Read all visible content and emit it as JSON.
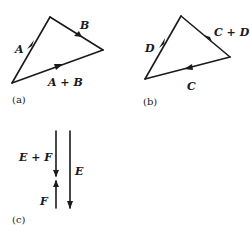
{
  "panels": {
    "a": {
      "caption": "(a)",
      "labels": {
        "A": "A",
        "B": "B",
        "sum": "A + B"
      }
    },
    "b": {
      "caption": "(b)",
      "labels": {
        "D": "D",
        "C": "C",
        "sum": "C + D"
      }
    },
    "c": {
      "caption": "(c)",
      "labels": {
        "sum": "E + F",
        "F": "F",
        "E": "E"
      }
    }
  },
  "colors": {
    "ink": "#1a1a1a",
    "background": "#ffffff"
  }
}
